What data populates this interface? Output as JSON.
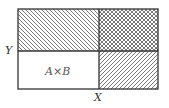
{
  "diagram": {
    "type": "product-set-region-diagram",
    "labels": {
      "y_axis": "Y",
      "x_axis": "X",
      "bottom_left_region": "A×B"
    },
    "regions": [
      {
        "name": "top-left",
        "fill": "diagonal-hatch-backslash"
      },
      {
        "name": "top-right",
        "fill": "crosshatch"
      },
      {
        "name": "bottom-left",
        "fill": "none",
        "label": "A×B"
      },
      {
        "name": "bottom-right",
        "fill": "diagonal-hatch-slash"
      }
    ],
    "colors": {
      "stroke": "#333333",
      "hatch": "#555555",
      "background": "#ffffff"
    }
  }
}
